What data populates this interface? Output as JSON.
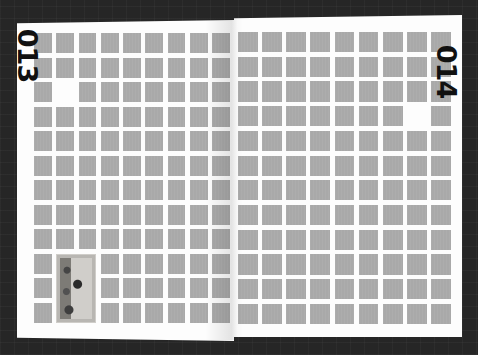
{
  "scene": {
    "description": "Open printed magazine spread with a grid of grey squares on a dark background",
    "background_color": "#262626",
    "paper_color": "#fdfdfd",
    "square_color": "#a9a9a9"
  },
  "left_page": {
    "page_number": "013",
    "grid": {
      "columns": 9,
      "rows": 12
    },
    "blank_cells": [
      {
        "row": 3,
        "col": 2
      }
    ],
    "image": {
      "row": 10,
      "col": 2,
      "row_span": 3,
      "col_span": 2,
      "label": "illuminated-manuscript-thumbnail"
    }
  },
  "right_page": {
    "page_number": "014",
    "grid": {
      "columns": 9,
      "rows": 12
    },
    "blank_cells": [
      {
        "row": 4,
        "col": 8
      }
    ]
  }
}
